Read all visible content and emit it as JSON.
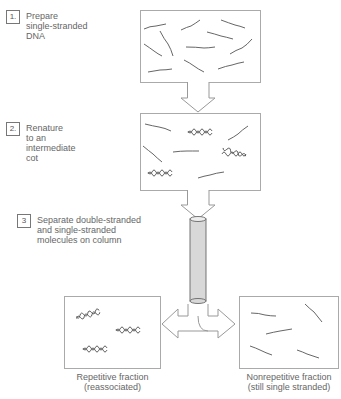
{
  "steps": [
    {
      "number": "1.",
      "text": "Prepare\nsingle-stranded\nDNA"
    },
    {
      "number": "2.",
      "text": "Renature\nto an\nintermediate\ncot"
    },
    {
      "number": "3",
      "text": "Separate double-stranded\nand single-stranded\nmolecules on column"
    }
  ],
  "captions": {
    "repetitive": "Repetitive fraction\n(reassociated)",
    "nonrepetitive": "Nonrepetitive fraction\n(still single stranded)"
  },
  "colors": {
    "line": "#999999",
    "strand": "#555555",
    "column": "#d8d8d8"
  }
}
